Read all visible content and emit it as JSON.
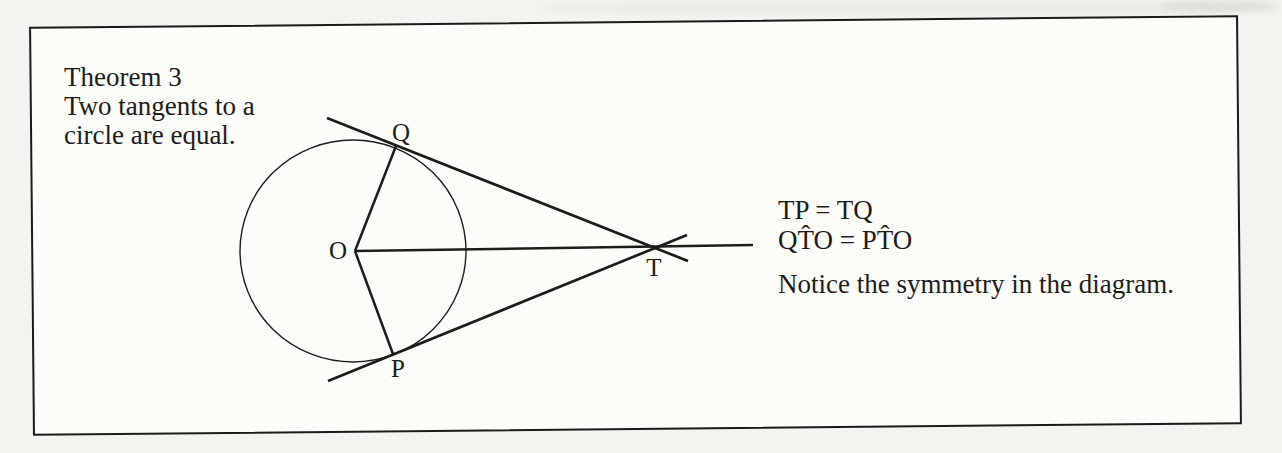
{
  "colors": {
    "ink": "#1c1c1c",
    "frame_border": "#1a1a1a",
    "paper_inside": "#fcfcf9",
    "page_background": "#f3f3ef"
  },
  "theorem": {
    "title": "Theorem 3",
    "statement_line1": "Two tangents to a",
    "statement_line2": "circle are equal."
  },
  "results": {
    "tangent_equality": "TP = TQ",
    "angle_equality": "QT̂O = PT̂O",
    "note": "Notice the symmetry in the diagram."
  },
  "diagram": {
    "stroke_color": "#1c1c1c",
    "circle": {
      "cx": 353,
      "cy": 251,
      "rx": 113,
      "ry": 111,
      "stroke_width": 1.4
    },
    "lines": [
      {
        "name": "radius-OQ-line",
        "x1": 355,
        "y1": 251,
        "x2": 396,
        "y2": 146,
        "w": 2.5
      },
      {
        "name": "radius-OP-line",
        "x1": 355,
        "y1": 251,
        "x2": 393,
        "y2": 354,
        "w": 2.5
      },
      {
        "name": "segment-OT-line",
        "x1": 355,
        "y1": 251,
        "x2": 753,
        "y2": 245,
        "w": 2.5
      },
      {
        "name": "tangent-TQ-line",
        "x1": 327,
        "y1": 118,
        "x2": 688,
        "y2": 261,
        "w": 2.7
      },
      {
        "name": "tangent-TP-line",
        "x1": 328,
        "y1": 381,
        "x2": 687,
        "y2": 235,
        "w": 2.7
      }
    ],
    "labels": [
      {
        "name": "label-O",
        "text": "O",
        "x": 338,
        "y": 259
      },
      {
        "name": "label-Q",
        "text": "Q",
        "x": 401,
        "y": 141
      },
      {
        "name": "label-P",
        "text": "P",
        "x": 398,
        "y": 377
      },
      {
        "name": "label-T",
        "text": "T",
        "x": 654,
        "y": 276
      }
    ]
  }
}
